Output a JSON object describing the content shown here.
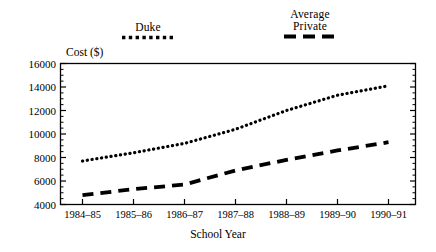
{
  "chart_data": {
    "type": "line",
    "title": "",
    "xlabel": "School Year",
    "ylabel": "Cost ($)",
    "categories": [
      "1984–85",
      "1985–86",
      "1986–87",
      "1987–88",
      "1988–89",
      "1989–90",
      "1990–91"
    ],
    "series": [
      {
        "name": "Duke",
        "style": "dotted",
        "values": [
          7700,
          8400,
          9200,
          10400,
          12000,
          13300,
          14100
        ]
      },
      {
        "name": "Average Private",
        "style": "dashed",
        "values": [
          4800,
          5300,
          5700,
          6900,
          7800,
          8600,
          9300
        ]
      }
    ],
    "ylim": [
      4000,
      16000
    ],
    "ytick_values": [
      4000,
      6000,
      8000,
      10000,
      12000,
      14000,
      16000
    ],
    "ytick_labels": [
      "4000",
      "6000",
      "8000",
      "10000",
      "12000",
      "14000",
      "16000"
    ],
    "yminor_step": 500,
    "grid": false,
    "legend_position": "above-plot",
    "line_color": "#000000",
    "axis_color": "#000000"
  },
  "legend": {
    "duke": {
      "label": "Duke"
    },
    "private": {
      "label_line1": "Average",
      "label_line2": "Private"
    }
  },
  "axes": {
    "y_title": "Cost ($)",
    "x_title": "School Year"
  }
}
